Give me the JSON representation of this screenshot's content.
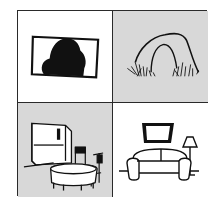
{
  "figure": {
    "layout": "2x2 grid",
    "colors": {
      "border": "#2a2a2a",
      "shade": "#d8d8d8",
      "ink": "#111111",
      "paper": "#ffffff"
    },
    "panels": [
      {
        "position": "top-left",
        "shaded": false,
        "depicts": "picture frame with dark silhouette"
      },
      {
        "position": "top-right",
        "shaded": true,
        "depicts": "rock arch with grass"
      },
      {
        "position": "bottom-left",
        "shaded": true,
        "depicts": "kitchen with refrigerator, round table and chairs"
      },
      {
        "position": "bottom-right",
        "shaded": false,
        "depicts": "living room with sofa, wall picture and floor lamp"
      }
    ]
  }
}
